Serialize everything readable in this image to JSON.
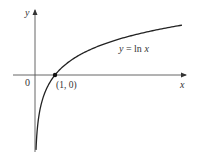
{
  "chart_data": {
    "type": "line",
    "title": "",
    "xlabel": "x",
    "ylabel": "y",
    "origin_label": "0",
    "series": [
      {
        "name": "y = ln x",
        "function": "ln(x)",
        "x": [
          0.05,
          0.1,
          0.2,
          0.3,
          0.5,
          0.75,
          1,
          1.5,
          2,
          3,
          4,
          5,
          6,
          7.35
        ],
        "values": [
          -3.0,
          -2.303,
          -1.609,
          -1.204,
          -0.693,
          -0.288,
          0,
          0.405,
          0.693,
          1.099,
          1.386,
          1.609,
          1.792,
          1.995
        ]
      }
    ],
    "annotations": [
      {
        "text": "(1, 0)",
        "x": 1,
        "y": 0,
        "marker": "dot"
      },
      {
        "text": "y = ln x",
        "position": "above curve, right side"
      }
    ],
    "xlim": [
      -1.1,
      8.3
    ],
    "ylim": [
      -3.3,
      2.5
    ],
    "grid": false,
    "legend": "none",
    "colors": {
      "curve": "#222222",
      "axes": "#555555",
      "text": "#333333"
    }
  },
  "labels": {
    "y_axis": "y",
    "x_axis": "x",
    "origin": "0",
    "point": "(1, 0)",
    "curve_label_y": "y",
    "curve_label_eq": " = ln ",
    "curve_label_x": "x"
  }
}
